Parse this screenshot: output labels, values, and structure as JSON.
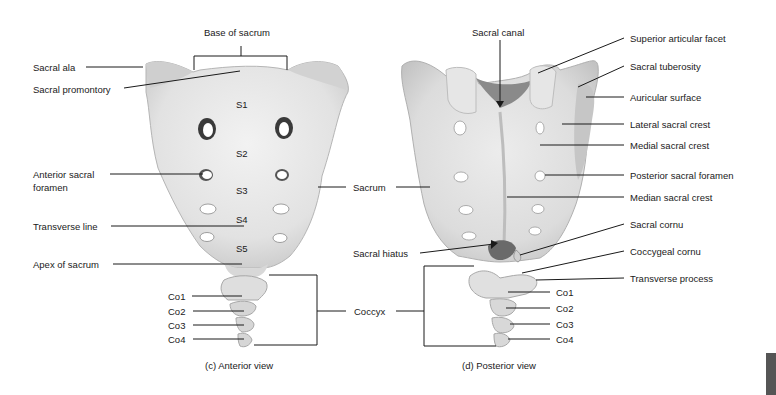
{
  "figure": {
    "anterior": {
      "caption": "(c) Anterior view",
      "labels": {
        "base_of_sacrum": "Base of sacrum",
        "sacral_ala": "Sacral ala",
        "sacral_promontory": "Sacral promontory",
        "anterior_sacral_foramen_1": "Anterior sacral",
        "anterior_sacral_foramen_2": "foramen",
        "transverse_line": "Transverse line",
        "apex_of_sacrum": "Apex of sacrum"
      },
      "segments": [
        "S1",
        "S2",
        "S3",
        "S4",
        "S5"
      ],
      "coccygeal": [
        "Co1",
        "Co2",
        "Co3",
        "Co4"
      ]
    },
    "shared": {
      "sacrum": "Sacrum",
      "sacral_hiatus": "Sacral hiatus",
      "coccyx": "Coccyx"
    },
    "posterior": {
      "caption": "(d) Posterior view",
      "labels": {
        "sacral_canal": "Sacral canal",
        "superior_articular_facet": "Superior articular facet",
        "sacral_tuberosity": "Sacral tuberosity",
        "auricular_surface": "Auricular surface",
        "lateral_sacral_crest": "Lateral sacral crest",
        "medial_sacral_crest": "Medial sacral crest",
        "posterior_sacral_foramen": "Posterior sacral foramen",
        "median_sacral_crest": "Median sacral crest",
        "sacral_cornu": "Sacral cornu",
        "coccygeal_cornu": "Coccygeal cornu",
        "transverse_process": "Transverse process"
      },
      "coccygeal": [
        "Co1",
        "Co2",
        "Co3",
        "Co4"
      ]
    },
    "colors": {
      "bone_light": "#ececec",
      "bone_shade": "#c9c9c9",
      "foramen": "#ffffff",
      "leader": "#1a1a1a",
      "tab": "#555555"
    }
  }
}
